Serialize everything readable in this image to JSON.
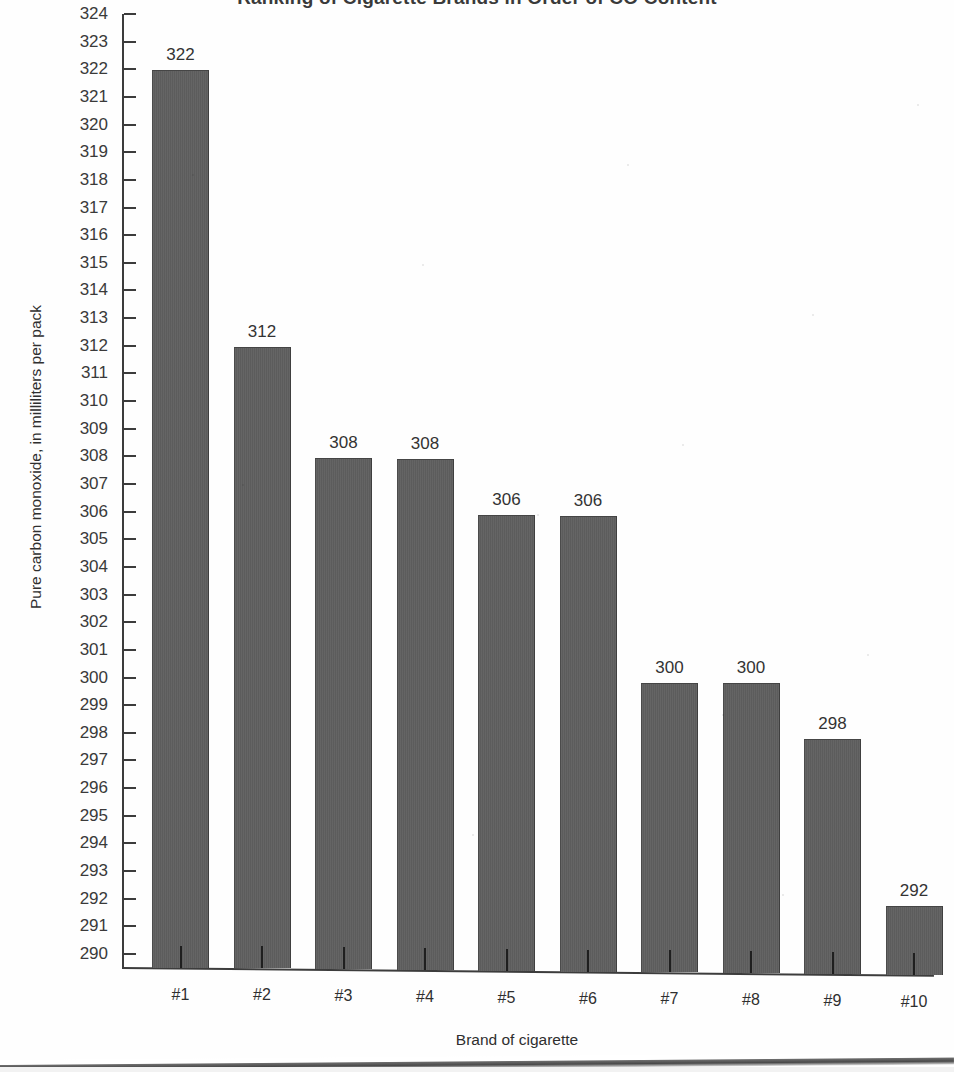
{
  "document": {
    "type": "scanned-figure",
    "page_edge_visible": true
  },
  "chart_data": {
    "type": "bar",
    "title": "Ranking of Cigarette Brands in Order of CO Content",
    "xlabel": "Brand of cigarette",
    "ylabel": "Pure carbon monoxide, in milliliters per pack",
    "categories": [
      "#1",
      "#2",
      "#3",
      "#4",
      "#5",
      "#6",
      "#7",
      "#8",
      "#9",
      "#10"
    ],
    "values": [
      322,
      312,
      308,
      308,
      306,
      306,
      300,
      300,
      298,
      292
    ],
    "data_labels": [
      "322",
      "312",
      "308",
      "308",
      "306",
      "306",
      "300",
      "300",
      "298",
      "292"
    ],
    "ylim": [
      289,
      324
    ],
    "ytick_min": 290,
    "ytick_max": 324,
    "ytick_step": 1,
    "yticks": [
      "324",
      "323",
      "322",
      "321",
      "320",
      "319",
      "318",
      "317",
      "316",
      "315",
      "314",
      "313",
      "312",
      "311",
      "310",
      "309",
      "308",
      "307",
      "306",
      "305",
      "304",
      "303",
      "302",
      "301",
      "300",
      "299",
      "298",
      "297",
      "296",
      "295",
      "294",
      "293",
      "292",
      "291",
      "290"
    ],
    "grid": false,
    "legend": null,
    "bar_color": "#5f5f5f",
    "axis_color": "#3c3c3c",
    "text_color": "#2f2f2f"
  }
}
